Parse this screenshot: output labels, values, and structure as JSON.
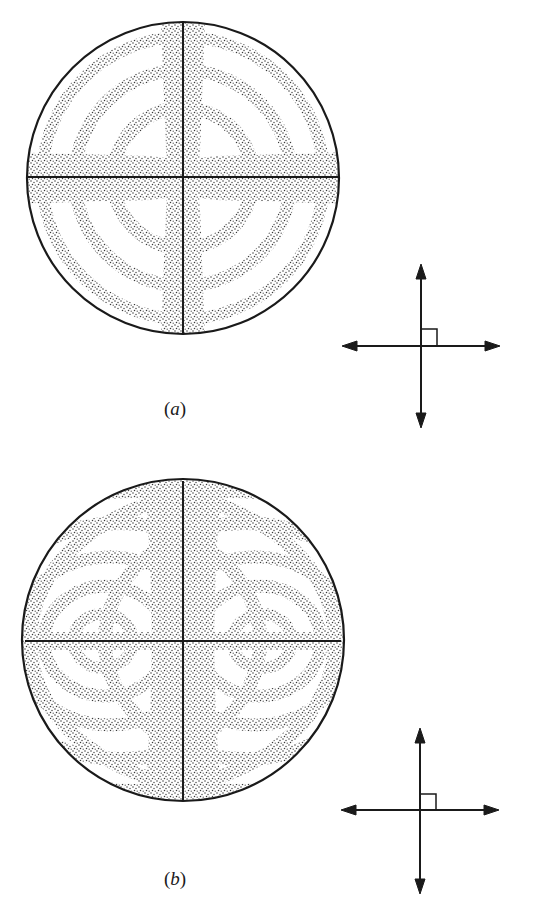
{
  "figure": {
    "type": "conoscopic interference figures",
    "colors": {
      "ink": "#1a1a1a",
      "stipple": "#3a3a3a",
      "background": "#ffffff"
    },
    "panels": [
      {
        "id": "a",
        "label_open": "(",
        "label_letter": "a",
        "label_close": ")",
        "description": "Uniaxial optic-axis figure: centered black cross (isogyres) with concentric isochromatic rings",
        "circle": {
          "cx": 183,
          "cy": 178,
          "r": 156
        },
        "isogyre_half_width": 21,
        "rings": [
          70,
          108,
          140
        ],
        "ring_band_width": 13
      },
      {
        "id": "b",
        "label_open": "(",
        "label_letter": "b",
        "label_close": ")",
        "description": "Biaxial acute bisectrix figure in extinction position: two melatopes with lemniscate isochromes",
        "circle": {
          "cx": 183,
          "cy": 640,
          "r": 161
        },
        "isogyre_half_width_top": 38,
        "isogyre_half_width_mid": 31,
        "melatopes": [
          {
            "x": 103,
            "y": 641
          },
          {
            "x": 262,
            "y": 641
          }
        ],
        "ring_band_width": 14
      }
    ],
    "polarizer_symbols": [
      {
        "panel": "a",
        "cx": 421,
        "cy": 346,
        "arm_h": 78,
        "arm_v": 78,
        "icon": "crossed-polars-icon"
      },
      {
        "panel": "b",
        "cx": 420,
        "cy": 810,
        "arm_h": 78,
        "arm_v": 80,
        "icon": "crossed-polars-icon"
      }
    ]
  }
}
